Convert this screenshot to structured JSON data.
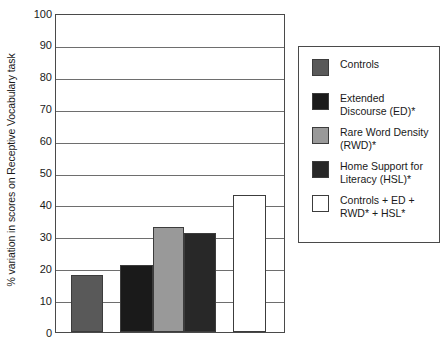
{
  "chart_data": {
    "type": "bar",
    "title": "",
    "xlabel": "",
    "ylabel": "% variation in scores on Receptive Vocabulary task",
    "ylim": [
      0,
      100
    ],
    "yticks": [
      0,
      10,
      20,
      30,
      40,
      50,
      60,
      70,
      80,
      90,
      100
    ],
    "ytick_labels": [
      "0",
      "10",
      "20",
      "30",
      "40",
      "50",
      "60",
      "70",
      "80",
      "90",
      "100"
    ],
    "grid": true,
    "grid_axis": "y",
    "legend_position": "right-outside",
    "xtick_labels": [],
    "categories": [
      "Controls",
      "Extended Discourse (ED)*",
      "Rare Word Density (RWD)*",
      "Home Support for Literacy (HSL)*",
      "Controls + ED + RWD* + HSL*"
    ],
    "values": [
      18,
      21,
      33,
      31,
      43
    ],
    "colors": [
      "#595959",
      "#1a1a1a",
      "#999999",
      "#282828",
      "#ffffff"
    ],
    "bars": [
      {
        "label": "Controls",
        "value": 18,
        "color": "#595959",
        "x": 70,
        "width": 32
      },
      {
        "label": "Extended Discourse (ED)*",
        "value": 21,
        "color": "#1a1a1a",
        "x": 119,
        "width": 33
      },
      {
        "label": "Rare Word Density (RWD)*",
        "value": 33,
        "color": "#999999",
        "x": 152,
        "width": 31
      },
      {
        "label": "Home Support for Literacy (HSL)*",
        "value": 31,
        "color": "#282828",
        "x": 183,
        "width": 32
      },
      {
        "label": "Controls + ED + RWD* + HSL*",
        "value": 43,
        "color": "#ffffff",
        "x": 232,
        "width": 33
      }
    ]
  },
  "legend": {
    "items": [
      {
        "label": "Controls",
        "color": "#595959"
      },
      {
        "label": "Extended\nDiscourse (ED)*",
        "color": "#1a1a1a"
      },
      {
        "label": "Rare Word Density\n(RWD)*",
        "color": "#999999"
      },
      {
        "label": "Home Support for\nLiteracy (HSL)*",
        "color": "#282828"
      },
      {
        "label": "Controls + ED +\nRWD* + HSL*",
        "color": "#ffffff"
      }
    ]
  }
}
